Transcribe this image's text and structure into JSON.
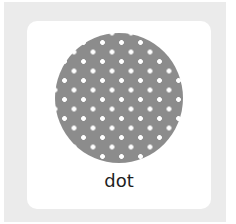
{
  "tile": {
    "label": "dot",
    "swatch_icon": "dot-pattern-circle",
    "colors": {
      "frame": "#ebebeb",
      "card": "#ffffff",
      "swatch": "#8c8c8c",
      "dots": "#ffffff"
    }
  }
}
